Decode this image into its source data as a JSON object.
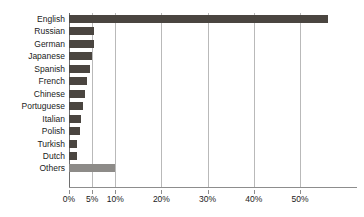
{
  "chart_data": {
    "type": "bar",
    "orientation": "horizontal",
    "title": "",
    "subtitle": "",
    "xlabel": "",
    "ylabel": "",
    "xlim": [
      0,
      62
    ],
    "grid": true,
    "legend": null,
    "value_suffix": "%",
    "categories": [
      "English",
      "Russian",
      "German",
      "Japanese",
      "Spanish",
      "French",
      "Chinese",
      "Portuguese",
      "Italian",
      "Polish",
      "Turkish",
      "Dutch",
      "Others"
    ],
    "values": [
      56.0,
      5.4,
      5.4,
      5.0,
      4.6,
      4.0,
      3.5,
      3.0,
      2.5,
      2.4,
      1.8,
      1.8,
      10.0
    ],
    "xticks": [
      0,
      5,
      10,
      20,
      30,
      40,
      50
    ],
    "xticklabels": [
      "0%",
      "5%",
      "10%",
      "20%",
      "30%",
      "40%",
      "50%"
    ],
    "bar_color": "#4a4540",
    "other_bar_color": "#8d8b88",
    "gridline_color": "#b9b9b9",
    "axis_color": "#8d8d8d",
    "background": "#ffffff"
  }
}
